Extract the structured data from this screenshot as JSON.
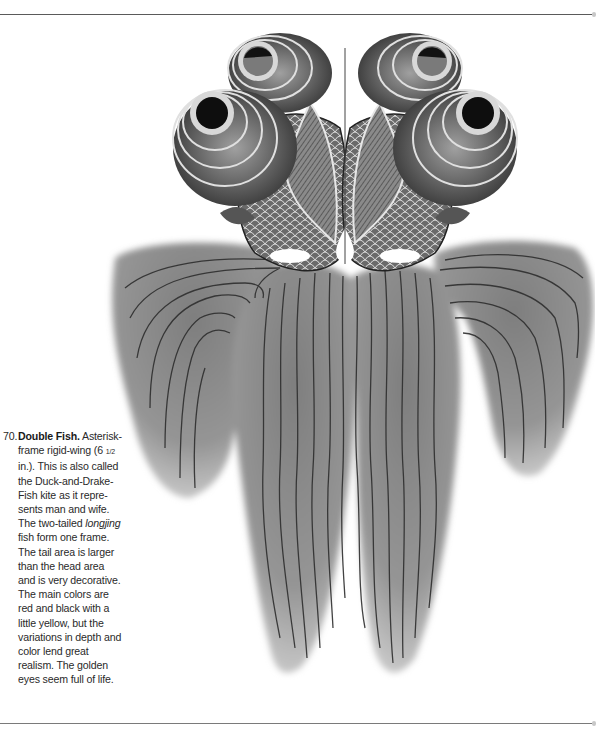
{
  "page": {
    "background": "#ffffff",
    "rule_color": "#5a5a5a"
  },
  "figure": {
    "tone": "grayscale",
    "colors": {
      "tail_fill": "#8e8e8e",
      "tail_edge": "#c4c4c4",
      "tail_stripe": "#2e2e2e",
      "body_fill": "#5c5c5c",
      "eye_ring": "#d8d8d8",
      "pupil": "#0e0e0e"
    }
  },
  "caption": {
    "number": "70.",
    "title": "Double Fish.",
    "lines": [
      " Asterisk-",
      "frame rigid-wing (6 ",
      "in.). This is also called",
      "the Duck-and-Drake-",
      "Fish kite as it repre-",
      "sents man and wife.",
      "The two-tailed ",
      "fish form one frame.",
      "The tail area is larger",
      "than the head area",
      "and is very decorative.",
      "The main colors are",
      "red and black with a",
      "little yellow, but the",
      "variations in depth and",
      "color lend great",
      "realism.  The golden",
      "eyes seem full of life."
    ],
    "fraction": "1/2",
    "italic_word": "longjing"
  }
}
